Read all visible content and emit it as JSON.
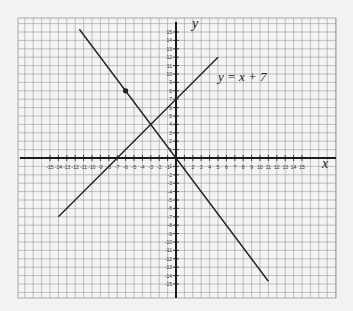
{
  "chart_data": {
    "type": "line",
    "title": "",
    "xlabel": "x",
    "ylabel": "y",
    "xlim": [
      -15,
      15
    ],
    "ylim": [
      -15,
      15
    ],
    "grid": true,
    "x_ticks": [
      -15,
      -14,
      -13,
      -12,
      -11,
      -10,
      -9,
      -8,
      -7,
      -6,
      -5,
      -4,
      -3,
      -2,
      -1,
      1,
      2,
      3,
      4,
      5,
      6,
      7,
      8,
      9,
      10,
      11,
      12,
      13,
      14,
      15
    ],
    "y_ticks": [
      -15,
      -14,
      -13,
      -12,
      -11,
      -10,
      -9,
      -8,
      -7,
      -6,
      -5,
      -4,
      -3,
      -2,
      -1,
      1,
      2,
      3,
      4,
      5,
      6,
      7,
      8,
      9,
      10,
      11,
      12,
      13,
      14,
      15
    ],
    "series": [
      {
        "name": "y = x + 7",
        "label": "y = x + 7",
        "equation": "y = x + 7",
        "x": [
          -14,
          5
        ],
        "y": [
          -7,
          12
        ]
      },
      {
        "name": "line through (-6, 8) and origin",
        "label": "",
        "equation": "y = -4/3 x",
        "x": [
          -11.5,
          11
        ],
        "y": [
          15.33,
          -14.67
        ]
      }
    ],
    "points": [
      {
        "x": -6,
        "y": 8,
        "label": ""
      }
    ],
    "annotations": [
      {
        "text": "y = x + 7",
        "x": 5.5,
        "y": 9.5
      }
    ],
    "intersection": {
      "x": -3,
      "y": 4
    }
  },
  "labels": {
    "x_axis": "x",
    "y_axis": "y",
    "equation": "y = x + 7"
  },
  "colors": {
    "background": "#f2f2f2",
    "grid": "#9a9a9a",
    "axis": "#1a1a1a",
    "line": "#222222"
  }
}
